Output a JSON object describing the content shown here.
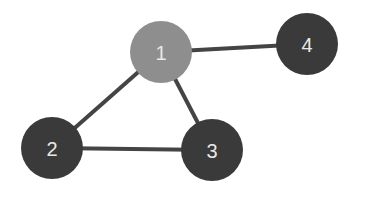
{
  "diagram": {
    "type": "graph",
    "nodes": [
      {
        "id": "1",
        "label": "1",
        "x": 161,
        "y": 52,
        "r": 31,
        "color": "#8e8e8e"
      },
      {
        "id": "2",
        "label": "2",
        "x": 52,
        "y": 148,
        "r": 31,
        "color": "#3a3a3a"
      },
      {
        "id": "3",
        "label": "3",
        "x": 212,
        "y": 150,
        "r": 31,
        "color": "#3a3a3a"
      },
      {
        "id": "4",
        "label": "4",
        "x": 307,
        "y": 44,
        "r": 31,
        "color": "#3a3a3a"
      }
    ],
    "edges": [
      {
        "from": "1",
        "to": "4"
      },
      {
        "from": "1",
        "to": "2"
      },
      {
        "from": "1",
        "to": "3"
      },
      {
        "from": "2",
        "to": "3"
      }
    ],
    "edge_color": "#444444"
  }
}
